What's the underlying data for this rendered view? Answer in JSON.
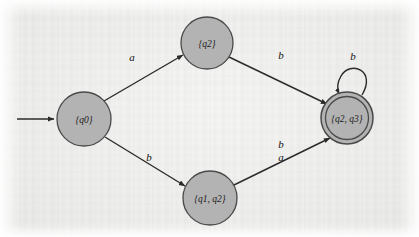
{
  "diagram": {
    "type": "finite-automaton-state-diagram",
    "title": "",
    "alphabet": [
      "a",
      "b"
    ],
    "colors": {
      "node_fill": "#b3b3b3",
      "node_stroke": "#4a4a4a",
      "edge_stroke": "#2b2b2b",
      "text": "#1a1a1a",
      "background": "#f0f0ee"
    },
    "start_arrow": {
      "name": "start-arrow",
      "from_x": 17,
      "to_x": 56,
      "y": 119
    },
    "states": [
      {
        "id": "q0",
        "label": "{q0}",
        "cx": 84,
        "cy": 119,
        "r": 27,
        "accepting": false,
        "start": true
      },
      {
        "id": "q2",
        "label": "{q2}",
        "cx": 207,
        "cy": 43,
        "r": 26,
        "accepting": false,
        "start": false
      },
      {
        "id": "q1q2",
        "label": "{q1, q2}",
        "cx": 210,
        "cy": 198,
        "r": 27,
        "accepting": false,
        "start": false
      },
      {
        "id": "q2q3",
        "label": "{q2, q3}",
        "cx": 347,
        "cy": 118,
        "r": 26,
        "accepting": true,
        "start": false
      }
    ],
    "transitions": [
      {
        "name": "edge-q0-to-q2",
        "from": "q0",
        "to": "q2",
        "label": "a",
        "label_x": 132,
        "label_y": 61
      },
      {
        "name": "edge-q2-to-q2q3",
        "from": "q2",
        "to": "q2q3",
        "label": "b",
        "label_x": 281,
        "label_y": 59
      },
      {
        "name": "edge-q0-to-q1q2",
        "from": "q0",
        "to": "q1q2",
        "label": "b",
        "label_x": 149,
        "label_y": 161
      },
      {
        "name": "edge-q1q2-to-q2q3",
        "from": "q1q2",
        "to": "q2q3",
        "label": "b",
        "label_x": 281,
        "label_y": 148
      },
      {
        "name": "edge-q1q2-to-q2q3-second",
        "from": "q1q2",
        "to": "q2q3",
        "label": "a",
        "label_x": 281,
        "label_y": 161
      },
      {
        "name": "self-loop-q2q3",
        "from": "q2q3",
        "to": "q2q3",
        "label": "b",
        "label_x": 353,
        "label_y": 60
      }
    ]
  }
}
